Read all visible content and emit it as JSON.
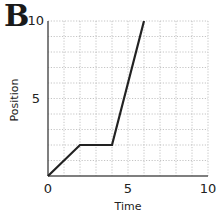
{
  "panel_label": "B",
  "chart_data": {
    "type": "line",
    "title": "",
    "xlabel": "Time",
    "ylabel": "Position",
    "xlim": [
      0,
      10
    ],
    "ylim": [
      0,
      10
    ],
    "x_ticks": [
      "0",
      "5",
      "10"
    ],
    "y_ticks": [
      "5",
      "10"
    ],
    "grid": true,
    "grid_step": 1,
    "legend": null,
    "series": [
      {
        "name": "position-vs-time",
        "x": [
          0,
          2,
          4,
          6
        ],
        "y": [
          0,
          2,
          2,
          10
        ],
        "color": "#222222"
      }
    ]
  }
}
